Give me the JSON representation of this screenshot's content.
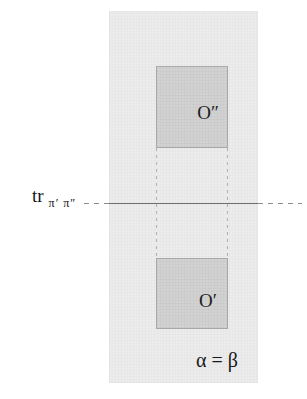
{
  "figure": {
    "background_color": "#ffffff",
    "band": {
      "name": "vertical-strip",
      "fill_color": "#ececec"
    },
    "orbits": [
      {
        "id": "orbit-upper",
        "label": "O″",
        "fill_color": "#d2d2d2",
        "border_color": "#a9a9a9"
      },
      {
        "id": "orbit-lower",
        "label": "O′",
        "fill_color": "#d2d2d2",
        "border_color": "#a9a9a9"
      }
    ],
    "trace": {
      "label_main": "tr",
      "label_subscript": "π′ π″",
      "line_color": "#6e6e6e",
      "dash_color": "#787878"
    },
    "annotation": {
      "text": "α = β"
    }
  }
}
